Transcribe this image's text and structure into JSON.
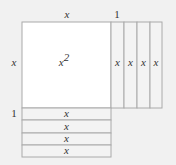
{
  "diagram": {
    "colors": {
      "background": "#f1f1f1",
      "tile_fill": "#ffffff",
      "strip_fill": "#f3f3f3",
      "stroke": "#aaaaaa",
      "text": "#333333"
    },
    "labels": {
      "top_x": "x",
      "top_one": "1",
      "left_x": "x",
      "left_one": "1",
      "square": "x",
      "square_exp": "2"
    },
    "vertical_strips": [
      "x",
      "x",
      "x",
      "x"
    ],
    "horizontal_strips": [
      "x",
      "x",
      "x",
      "x"
    ]
  }
}
